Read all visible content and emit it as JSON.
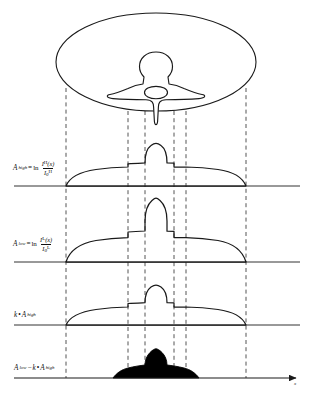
{
  "figure": {
    "domain": "dual-energy-absorptiometry-profiles",
    "axis_label": "x",
    "panels": [
      {
        "id": "anatomy",
        "name": "body-cross-section-with-vertebra",
        "label": "",
        "description": "elliptical body cross-section containing vertebra outline"
      },
      {
        "id": "high",
        "name": "high-energy-attenuation-profile",
        "label_parts": {
          "symbol": "A",
          "subscript": "high",
          "equals": "=",
          "operator": "ln",
          "numerator": "I",
          "numerator_sup": "H",
          "numerator_arg": "(x)",
          "denominator": "I",
          "denominator_sub": "0",
          "denominator_sup": "H"
        }
      },
      {
        "id": "low",
        "name": "low-energy-attenuation-profile",
        "label_parts": {
          "symbol": "A",
          "subscript": "low",
          "equals": "=",
          "operator": "ln",
          "numerator": "I",
          "numerator_sup": "L",
          "numerator_arg": "(x)",
          "denominator": "I",
          "denominator_sub": "0",
          "denominator_sup": "L"
        }
      },
      {
        "id": "scaled",
        "name": "scaled-high-energy-profile",
        "label_parts": {
          "factor": "k",
          "dot": "•",
          "symbol": "A",
          "subscript": "high"
        }
      },
      {
        "id": "subtracted",
        "name": "bone-only-subtraction-profile",
        "label_parts": {
          "symbol": "A",
          "subscript": "low",
          "minus": "−",
          "factor": "k",
          "dot": "•",
          "symbol2": "A",
          "subscript2": "high"
        }
      }
    ],
    "guides": {
      "name": "vertical-dashed-alignment-guides",
      "count": 6,
      "x_positions": [
        66,
        128,
        145,
        174,
        186,
        246
      ]
    },
    "colors": {
      "stroke": "#1a1a1a",
      "fill": "#000000",
      "guide": "#555555",
      "baseline": "#333333"
    }
  },
  "caption": {
    "text": ""
  }
}
